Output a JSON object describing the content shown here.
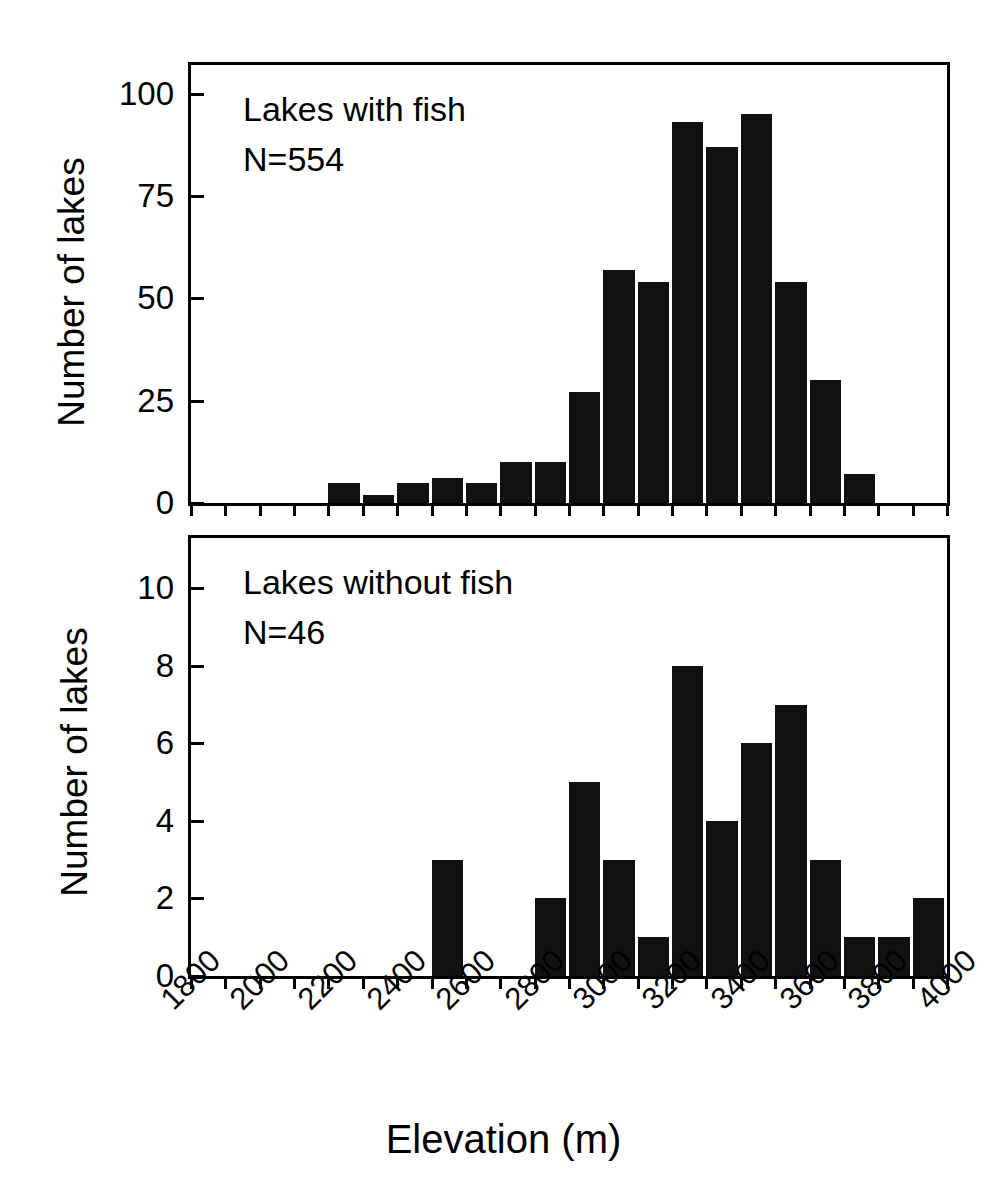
{
  "figure": {
    "xlabel": "Elevation (m)",
    "ylabel_top": "Number of lakes",
    "ylabel_bottom": "Number of lakes"
  },
  "panels": {
    "top": {
      "title": "Lakes with fish",
      "n_label": "N=554"
    },
    "bottom": {
      "title": "Lakes without fish",
      "n_label": "N=46"
    }
  },
  "chart_data": [
    {
      "type": "bar",
      "title": "Lakes with fish",
      "annotation": "N=554",
      "xlabel": "Elevation (m)",
      "ylabel": "Number of lakes",
      "xlim": [
        1800,
        4000
      ],
      "ylim": [
        0,
        107
      ],
      "grid": false,
      "legend": null,
      "bin_width": 100,
      "yticks": [
        0,
        25,
        50,
        75,
        100
      ],
      "ytick_labels": [
        "0",
        "25",
        "50",
        "75",
        "100"
      ],
      "xticks": [
        1800,
        1900,
        2000,
        2100,
        2200,
        2300,
        2400,
        2500,
        2600,
        2700,
        2800,
        2900,
        3000,
        3100,
        3200,
        3300,
        3400,
        3500,
        3600,
        3700,
        3800,
        3900,
        4000
      ],
      "xtick_labels": [
        "1800",
        "2000",
        "2200",
        "2400",
        "2600",
        "2800",
        "3000",
        "3200",
        "3400",
        "3600",
        "3800",
        "4000"
      ],
      "bins": [
        {
          "start": 2200,
          "end": 2300,
          "value": 5
        },
        {
          "start": 2300,
          "end": 2400,
          "value": 2
        },
        {
          "start": 2400,
          "end": 2500,
          "value": 5
        },
        {
          "start": 2500,
          "end": 2600,
          "value": 6
        },
        {
          "start": 2600,
          "end": 2700,
          "value": 5
        },
        {
          "start": 2700,
          "end": 2800,
          "value": 10
        },
        {
          "start": 2800,
          "end": 2900,
          "value": 10
        },
        {
          "start": 2900,
          "end": 3000,
          "value": 27
        },
        {
          "start": 3000,
          "end": 3100,
          "value": 57
        },
        {
          "start": 3100,
          "end": 3200,
          "value": 54
        },
        {
          "start": 3200,
          "end": 3300,
          "value": 93
        },
        {
          "start": 3300,
          "end": 3400,
          "value": 87
        },
        {
          "start": 3400,
          "end": 3500,
          "value": 95
        },
        {
          "start": 3500,
          "end": 3600,
          "value": 54
        },
        {
          "start": 3600,
          "end": 3700,
          "value": 30
        },
        {
          "start": 3700,
          "end": 3800,
          "value": 7
        }
      ]
    },
    {
      "type": "bar",
      "title": "Lakes without fish",
      "annotation": "N=46",
      "xlabel": "Elevation (m)",
      "ylabel": "Number of lakes",
      "xlim": [
        1800,
        4000
      ],
      "ylim": [
        0,
        11.3
      ],
      "grid": false,
      "legend": null,
      "bin_width": 100,
      "yticks": [
        0,
        2,
        4,
        6,
        8,
        10
      ],
      "ytick_labels": [
        "0",
        "2",
        "4",
        "6",
        "8",
        "10"
      ],
      "xticks": [
        1800,
        1900,
        2000,
        2100,
        2200,
        2300,
        2400,
        2500,
        2600,
        2700,
        2800,
        2900,
        3000,
        3100,
        3200,
        3300,
        3400,
        3500,
        3600,
        3700,
        3800,
        3900,
        4000
      ],
      "xtick_labels": [
        "1800",
        "2000",
        "2200",
        "2400",
        "2600",
        "2800",
        "3000",
        "3200",
        "3400",
        "3600",
        "3800",
        "4000"
      ],
      "bins": [
        {
          "start": 2500,
          "end": 2600,
          "value": 3
        },
        {
          "start": 2800,
          "end": 2900,
          "value": 2
        },
        {
          "start": 2900,
          "end": 3000,
          "value": 5
        },
        {
          "start": 3000,
          "end": 3100,
          "value": 3
        },
        {
          "start": 3100,
          "end": 3200,
          "value": 1
        },
        {
          "start": 3200,
          "end": 3300,
          "value": 8
        },
        {
          "start": 3300,
          "end": 3400,
          "value": 4
        },
        {
          "start": 3400,
          "end": 3500,
          "value": 6
        },
        {
          "start": 3500,
          "end": 3600,
          "value": 7
        },
        {
          "start": 3600,
          "end": 3700,
          "value": 3
        },
        {
          "start": 3700,
          "end": 3800,
          "value": 1
        },
        {
          "start": 3800,
          "end": 3900,
          "value": 1
        },
        {
          "start": 3900,
          "end": 4000,
          "value": 2
        }
      ]
    }
  ]
}
